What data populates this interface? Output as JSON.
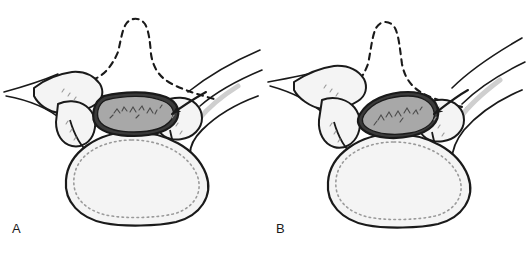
{
  "figure": {
    "background_color": "#ffffff",
    "ink_color": "#1a1a1a",
    "bone_fill_color": "#f4f4f4",
    "canal_fill_color": "#a8a8a8",
    "stipple_color": "#8c8c8c",
    "panel_count": 2
  },
  "panels": [
    {
      "id": "panel-a",
      "label": "A",
      "canal_state": "wide oval spinal canal, symmetric",
      "canal_orientation": "horizontal",
      "arrow_present": true,
      "arrow_direction": "right-to-left toward canal",
      "dashed_outline": "spinous process and laminae shown as dashed contour"
    },
    {
      "id": "panel-b",
      "label": "B",
      "canal_state": "narrowed spinal canal, rotated and compressed",
      "canal_orientation": "tilted down-left",
      "arrow_present": true,
      "arrow_direction": "right-to-left toward canal",
      "dashed_outline": "spinous process and laminae shown as dashed contour"
    }
  ]
}
